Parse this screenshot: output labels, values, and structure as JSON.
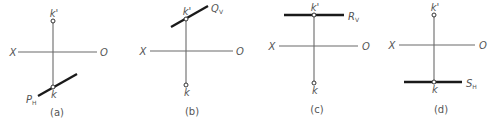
{
  "colors": {
    "axis": "#6a6a6a",
    "trace": "#1a1a1a",
    "text": "#555555"
  },
  "panels": [
    {
      "id": "a",
      "caption": "(a)",
      "axis": {
        "x_label": "X",
        "o_label": "O",
        "x1": 18,
        "x2": 97,
        "y": 52,
        "xl": 13,
        "ol": 104
      },
      "projector": {
        "x": 53,
        "y1": 21,
        "y2": 87
      },
      "point_v": {
        "label": "k'",
        "x": 53,
        "y": 21
      },
      "point_h": {
        "label": "k",
        "x": 53,
        "y": 87
      },
      "trace": {
        "main": "P",
        "sub": "H",
        "x1": 38,
        "y1": 96,
        "x2": 77,
        "y2": 74,
        "lx": 26,
        "ly": 103
      },
      "caption_pos": {
        "x": 57,
        "y": 116
      }
    },
    {
      "id": "b",
      "caption": "(b)",
      "axis": {
        "x_label": "X",
        "o_label": "O",
        "x1": 150,
        "x2": 233,
        "y": 51,
        "xl": 143,
        "ol": 240
      },
      "projector": {
        "x": 186,
        "y1": 19,
        "y2": 85
      },
      "point_v": {
        "label": "k'",
        "x": 186,
        "y": 19
      },
      "point_h": {
        "label": "k",
        "x": 186,
        "y": 85
      },
      "trace": {
        "main": "Q",
        "sub": "V",
        "x1": 171,
        "y1": 27,
        "x2": 208,
        "y2": 6,
        "lx": 211,
        "ly": 12
      },
      "caption_pos": {
        "x": 192,
        "y": 115
      }
    },
    {
      "id": "c",
      "caption": "(c)",
      "axis": {
        "x_label": "X",
        "o_label": "O",
        "x1": 279,
        "x2": 358,
        "y": 46,
        "xl": 272,
        "ol": 366
      },
      "projector": {
        "x": 314,
        "y1": 15,
        "y2": 83
      },
      "point_v": {
        "label": "k'",
        "x": 314,
        "y": 15
      },
      "point_h": {
        "label": "k",
        "x": 314,
        "y": 83
      },
      "trace": {
        "main": "R",
        "sub": "V",
        "x1": 284,
        "y1": 15,
        "x2": 344,
        "y2": 15,
        "lx": 348,
        "ly": 20
      },
      "caption_pos": {
        "x": 317,
        "y": 113
      }
    },
    {
      "id": "d",
      "caption": "(d)",
      "axis": {
        "x_label": "X",
        "o_label": "O",
        "x1": 399,
        "x2": 475,
        "y": 45,
        "xl": 392,
        "ol": 483
      },
      "projector": {
        "x": 434,
        "y1": 15,
        "y2": 82
      },
      "point_v": {
        "label": "k'",
        "x": 434,
        "y": 15
      },
      "point_h": {
        "label": "k",
        "x": 434,
        "y": 82
      },
      "trace": {
        "main": "S",
        "sub": "H",
        "x1": 404,
        "y1": 82,
        "x2": 462,
        "y2": 82,
        "lx": 466,
        "ly": 87
      },
      "caption_pos": {
        "x": 441,
        "y": 113
      }
    }
  ]
}
